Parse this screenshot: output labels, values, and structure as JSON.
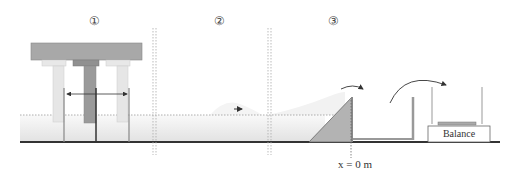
{
  "stages": [
    {
      "label": "①",
      "name": "wave generation"
    },
    {
      "label": "②",
      "name": "wave propagation"
    },
    {
      "label": "③",
      "name": "overtopping and collection"
    }
  ],
  "annotations": {
    "origin_label": "x = 0 m",
    "balance_label": "Balance"
  },
  "colors": {
    "water_top": "#f7f7f7",
    "water_bottom": "#e6e6e6",
    "floor": "#333333",
    "block": "#a8a8a8",
    "ramp": "#b3b3b3",
    "divider": "#aaaaaa"
  }
}
